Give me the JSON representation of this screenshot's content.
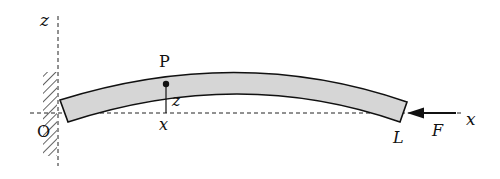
{
  "diagram": {
    "labels": {
      "z_axis": "z",
      "x_axis": "x",
      "origin": "O",
      "point": "P",
      "point_z": "z",
      "point_x": "x",
      "end": "L",
      "force": "F"
    },
    "colors": {
      "beam_fill": "#d6d6d6",
      "stroke": "#111111",
      "background": "#ffffff"
    }
  }
}
